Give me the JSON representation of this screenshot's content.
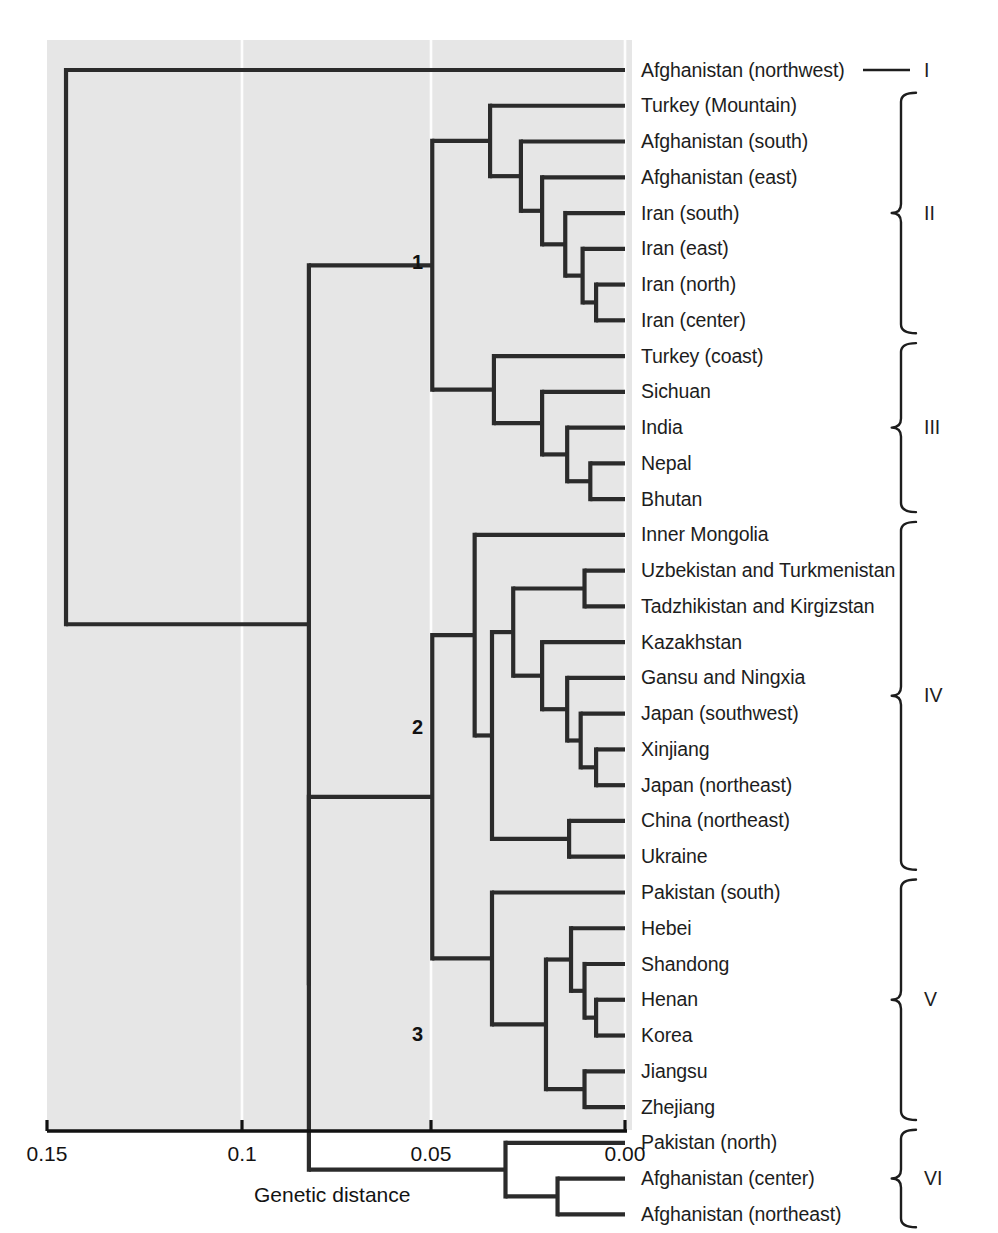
{
  "figure": {
    "type": "dendrogram",
    "panel": {
      "background": "#e6e6e6",
      "left": 47,
      "top": 40,
      "right": 632,
      "bottom": 1130
    },
    "line_color": "#2b2b2b",
    "gridline_color": "#fdfdfd"
  },
  "axis": {
    "title": "Genetic distance",
    "ticks": [
      {
        "label": "0.15",
        "value": 0.15,
        "x": 47
      },
      {
        "label": "0.1",
        "value": 0.1,
        "x": 242
      },
      {
        "label": "0.05",
        "value": 0.05,
        "x": 431
      },
      {
        "label": "0.00",
        "value": 0.0,
        "x": 625
      }
    ],
    "direction": "reversed",
    "min": 0.0,
    "max": 0.15
  },
  "node_labels": [
    {
      "text": "1",
      "x": 412,
      "y": 252
    },
    {
      "text": "2",
      "x": 412,
      "y": 717
    },
    {
      "text": "3",
      "x": 412,
      "y": 1024
    }
  ],
  "groups": [
    {
      "roman": "I",
      "marker": "dash",
      "first": 0,
      "last": 0
    },
    {
      "roman": "II",
      "marker": "brace",
      "first": 1,
      "last": 7
    },
    {
      "roman": "III",
      "marker": "brace",
      "first": 8,
      "last": 12
    },
    {
      "roman": "IV",
      "marker": "brace",
      "first": 13,
      "last": 22
    },
    {
      "roman": "V",
      "marker": "brace",
      "first": 23,
      "last": 29
    },
    {
      "roman": "VI",
      "marker": "brace",
      "first": 30,
      "last": 32
    }
  ],
  "chart_data": {
    "type": "dendrogram",
    "title": "",
    "xlabel": "Genetic distance",
    "ylabel": "",
    "xlim": [
      0.15,
      0.0
    ],
    "grid": true,
    "leaf_count": 30,
    "leaves": [
      "Afghanistan (northwest)",
      "Turkey (Mountain)",
      "Afghanistan (south)",
      "Afghanistan (east)",
      "Iran (south)",
      "Iran (east)",
      "Iran (north)",
      "Iran (center)",
      "Turkey (coast)",
      "Sichuan",
      "India",
      "Nepal",
      "Bhutan",
      "Inner Mongolia",
      "Uzbekistan and Turkmenistan",
      "Tadzhikistan and Kirgizstan",
      "Kazakhstan",
      "Gansu and Ningxia",
      "Japan (southwest)",
      "Xinjiang",
      "Japan (northeast)",
      "China (northeast)",
      "Ukraine",
      "Pakistan (south)",
      "Hebei",
      "Shandong",
      "Henan",
      "Korea",
      "Jiangsu",
      "Zhejiang",
      "Pakistan (north)",
      "Afghanistan (center)",
      "Afghanistan (northeast)"
    ],
    "cluster_labels": [
      "I",
      "II",
      "III",
      "IV",
      "V",
      "VI"
    ],
    "cluster_members": {
      "I": [
        "Afghanistan (northwest)"
      ],
      "II": [
        "Turkey (Mountain)",
        "Afghanistan (south)",
        "Afghanistan (east)",
        "Iran (south)",
        "Iran (east)",
        "Iran (north)",
        "Iran (center)"
      ],
      "III": [
        "Turkey (coast)",
        "Sichuan",
        "India",
        "Nepal",
        "Bhutan"
      ],
      "IV": [
        "Inner Mongolia",
        "Uzbekistan and Turkmenistan",
        "Tadzhikistan and Kirgizstan",
        "Kazakhstan",
        "Gansu and Ningxia",
        "Japan (southwest)",
        "Xinjiang",
        "Japan (northeast)",
        "China (northeast)",
        "Ukraine"
      ],
      "V": [
        "Pakistan (south)",
        "Hebei",
        "Shandong",
        "Henan",
        "Korea",
        "Jiangsu",
        "Zhejiang"
      ],
      "VI": [
        "Pakistan (north)",
        "Afghanistan (center)",
        "Afghanistan (northeast)"
      ]
    },
    "numbered_nodes": [
      {
        "label": "1",
        "distance": 0.05,
        "joins": [
          "II",
          "III"
        ]
      },
      {
        "label": "2",
        "distance": 0.05,
        "joins": [
          "IV",
          "V"
        ]
      },
      {
        "label": "3",
        "distance": 0.031,
        "joins": [
          "VI"
        ]
      }
    ],
    "merges": [
      {
        "id": "m1",
        "children": [
          "Xinjiang",
          "Japan (northeast)"
        ],
        "distance": 0.0075
      },
      {
        "id": "m2",
        "children": [
          "Japan (southwest)",
          "m1"
        ],
        "distance": 0.0115
      },
      {
        "id": "m3",
        "children": [
          "Gansu and Ningxia",
          "m2"
        ],
        "distance": 0.015
      },
      {
        "id": "m4",
        "children": [
          "Kazakhstan",
          "m3"
        ],
        "distance": 0.0215
      },
      {
        "id": "m5",
        "children": [
          "Uzbekistan and Turkmenistan",
          "Tadzhikistan and Kirgizstan"
        ],
        "distance": 0.0105
      },
      {
        "id": "m6",
        "children": [
          "m5",
          "m4"
        ],
        "distance": 0.029
      },
      {
        "id": "m7",
        "children": [
          "China (northeast)",
          "Ukraine"
        ],
        "distance": 0.0145
      },
      {
        "id": "m8",
        "children": [
          "m6",
          "m7"
        ],
        "distance": 0.0345
      },
      {
        "id": "m9",
        "children": [
          "Inner Mongolia",
          "m8"
        ],
        "distance": 0.039
      },
      {
        "id": "m10",
        "children": [
          "Henan",
          "Korea"
        ],
        "distance": 0.0075
      },
      {
        "id": "m11",
        "children": [
          "Shandong",
          "m10"
        ],
        "distance": 0.0105
      },
      {
        "id": "m12",
        "children": [
          "Hebei",
          "m11"
        ],
        "distance": 0.014
      },
      {
        "id": "m13",
        "children": [
          "Jiangsu",
          "Zhejiang"
        ],
        "distance": 0.0105
      },
      {
        "id": "m14",
        "children": [
          "m12",
          "m13"
        ],
        "distance": 0.0205
      },
      {
        "id": "m15",
        "children": [
          "Pakistan (south)",
          "m14"
        ],
        "distance": 0.0345
      },
      {
        "id": "m16",
        "children": [
          "m9",
          "m15"
        ],
        "distance": 0.05
      },
      {
        "id": "m17",
        "children": [
          "Afghanistan (center)",
          "Afghanistan (northeast)"
        ],
        "distance": 0.0175
      },
      {
        "id": "m18",
        "children": [
          "Pakistan (north)",
          "m17"
        ],
        "distance": 0.031
      },
      {
        "id": "m19",
        "children": [
          "m16",
          "m18"
        ],
        "distance": 0.082
      },
      {
        "id": "m20",
        "children": [
          "Iran (north)",
          "Iran (center)"
        ],
        "distance": 0.0075
      },
      {
        "id": "m21",
        "children": [
          "Iran (east)",
          "m20"
        ],
        "distance": 0.011
      },
      {
        "id": "m22",
        "children": [
          "Iran (south)",
          "m21"
        ],
        "distance": 0.0155
      },
      {
        "id": "m23",
        "children": [
          "Afghanistan (east)",
          "m22"
        ],
        "distance": 0.0215
      },
      {
        "id": "m24",
        "children": [
          "Afghanistan (south)",
          "m23"
        ],
        "distance": 0.027
      },
      {
        "id": "m25",
        "children": [
          "Turkey (Mountain)",
          "m24"
        ],
        "distance": 0.035
      },
      {
        "id": "m26",
        "children": [
          "Nepal",
          "Bhutan"
        ],
        "distance": 0.009
      },
      {
        "id": "m27",
        "children": [
          "India",
          "m26"
        ],
        "distance": 0.015
      },
      {
        "id": "m28",
        "children": [
          "Sichuan",
          "m27"
        ],
        "distance": 0.0215
      },
      {
        "id": "m29",
        "children": [
          "Turkey (coast)",
          "m28"
        ],
        "distance": 0.034
      },
      {
        "id": "m30",
        "children": [
          "m25",
          "m29"
        ],
        "distance": 0.05
      },
      {
        "id": "m31",
        "children": [
          "m30",
          "m19"
        ],
        "distance": 0.082
      },
      {
        "id": "root",
        "children": [
          "Afghanistan (northwest)",
          "m31"
        ],
        "distance": 0.145
      }
    ]
  }
}
